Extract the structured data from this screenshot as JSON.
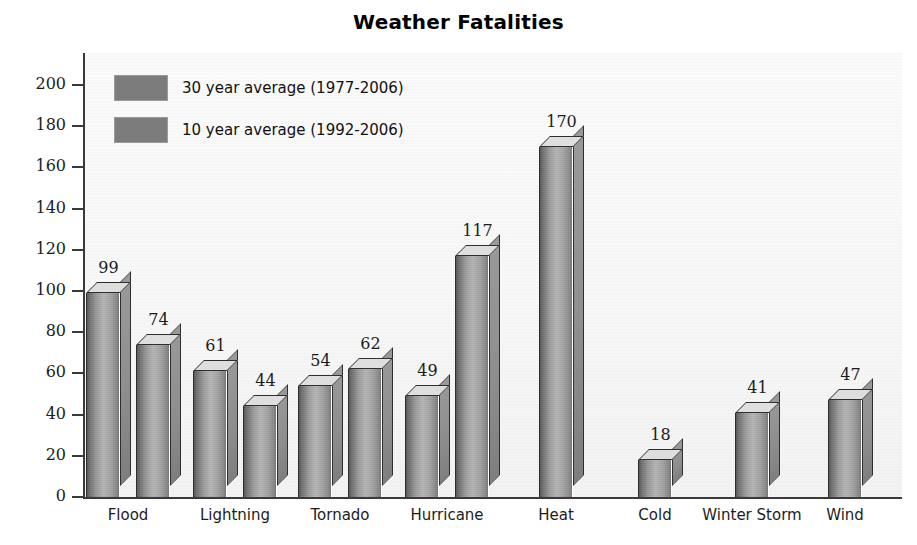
{
  "chart_data": {
    "type": "bar",
    "title": "Weather Fatalities",
    "xlabel": "",
    "ylabel": "",
    "ylim": [
      0,
      200
    ],
    "ytick_step": 20,
    "yticks": [
      0,
      20,
      40,
      60,
      80,
      100,
      120,
      140,
      160,
      180,
      200
    ],
    "grid": false,
    "legend_position": "top-left-inside",
    "categories": [
      "Flood",
      "Lightning",
      "Tornado",
      "Hurricane",
      "Heat",
      "Cold",
      "Winter Storm",
      "Wind"
    ],
    "series": [
      {
        "name": "30 year average (1977-2006)",
        "color": "#7c7c7c",
        "values": [
          99,
          61,
          54,
          49,
          170,
          18,
          41,
          47
        ]
      },
      {
        "name": "10 year average (1992-2006)",
        "color": "#7c7c7c",
        "values": [
          74,
          44,
          62,
          117,
          null,
          null,
          null,
          null
        ]
      }
    ]
  },
  "title": "Weather Fatalities",
  "legend": {
    "items": [
      {
        "label": "30 year average (1977-2006)",
        "swatch_color": "#7c7c7c"
      },
      {
        "label": "10 year average (1992-2006)",
        "swatch_color": "#7c7c7c"
      }
    ]
  },
  "y_axis": {
    "ticks": [
      "200",
      "180",
      "160",
      "140",
      "120",
      "100",
      "80",
      "60",
      "40",
      "20",
      "0"
    ]
  },
  "x_axis": {
    "categories": [
      "Flood",
      "Lightning",
      "Tornado",
      "Hurricane",
      "Heat",
      "Cold",
      "Winter Storm",
      "Wind"
    ]
  },
  "bar_values": {
    "flood_30": "99",
    "flood_10": "74",
    "lightning_30": "61",
    "lightning_10": "44",
    "tornado_30": "54",
    "tornado_10": "62",
    "hurricane_30": "49",
    "hurricane_10": "117",
    "heat_30": "170",
    "cold_30": "18",
    "winter_storm_30": "41",
    "wind_30": "47"
  },
  "colors": {
    "bar_face_light": "#b4b4b4",
    "bar_face_dark": "#565656",
    "bar_top": "#dedede",
    "bar_side": "#8d8d8d",
    "axis": "#3a3a3a",
    "plot_background": "#f7f7f7",
    "text": "#1c1c1c"
  }
}
